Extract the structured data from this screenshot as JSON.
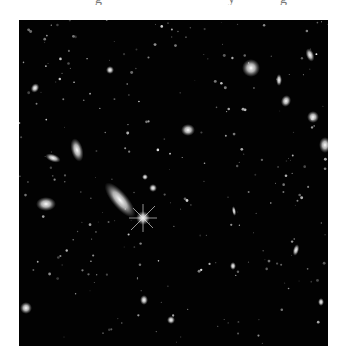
{
  "page": {
    "top_text_fragments": [
      "g",
      "y",
      "g"
    ]
  },
  "figure": {
    "background_color": "#020202",
    "frame": {
      "x": 19,
      "y": 20,
      "width": 309,
      "height": 326
    },
    "objects": [
      {
        "type": "star",
        "x": 143,
        "y": 218,
        "r": 7,
        "spikes": true
      },
      {
        "type": "galaxy",
        "x": 120,
        "y": 200,
        "rx": 22,
        "ry": 8,
        "rot": 50
      },
      {
        "type": "galaxy",
        "x": 46,
        "y": 204,
        "rx": 10,
        "ry": 7,
        "rot": 0
      },
      {
        "type": "galaxy",
        "x": 77,
        "y": 150,
        "rx": 6,
        "ry": 12,
        "rot": -15
      },
      {
        "type": "galaxy",
        "x": 53,
        "y": 158,
        "rx": 8,
        "ry": 4,
        "rot": 20
      },
      {
        "type": "galaxy",
        "x": 188,
        "y": 130,
        "rx": 7,
        "ry": 6,
        "rot": 0
      },
      {
        "type": "galaxy",
        "x": 251,
        "y": 68,
        "rx": 9,
        "ry": 9,
        "rot": 0
      },
      {
        "type": "galaxy",
        "x": 310,
        "y": 55,
        "rx": 4,
        "ry": 7,
        "rot": -20
      },
      {
        "type": "galaxy",
        "x": 279,
        "y": 80,
        "rx": 3,
        "ry": 6,
        "rot": 0
      },
      {
        "type": "galaxy",
        "x": 286,
        "y": 101,
        "rx": 5,
        "ry": 6,
        "rot": 20
      },
      {
        "type": "galaxy",
        "x": 313,
        "y": 117,
        "rx": 6,
        "ry": 6,
        "rot": 0
      },
      {
        "type": "galaxy",
        "x": 325,
        "y": 145,
        "rx": 6,
        "ry": 8,
        "rot": 0
      },
      {
        "type": "galaxy",
        "x": 110,
        "y": 70,
        "rx": 4,
        "ry": 4,
        "rot": 0
      },
      {
        "type": "galaxy",
        "x": 35,
        "y": 88,
        "rx": 4,
        "ry": 5,
        "rot": 30
      },
      {
        "type": "galaxy",
        "x": 26,
        "y": 308,
        "rx": 6,
        "ry": 6,
        "rot": 0
      },
      {
        "type": "galaxy",
        "x": 144,
        "y": 300,
        "rx": 4,
        "ry": 5,
        "rot": 0
      },
      {
        "type": "galaxy",
        "x": 171,
        "y": 320,
        "rx": 4,
        "ry": 4,
        "rot": 0
      },
      {
        "type": "galaxy",
        "x": 233,
        "y": 266,
        "rx": 3,
        "ry": 4,
        "rot": 0
      },
      {
        "type": "galaxy",
        "x": 296,
        "y": 250,
        "rx": 3,
        "ry": 6,
        "rot": 15
      },
      {
        "type": "galaxy",
        "x": 234,
        "y": 211,
        "rx": 2,
        "ry": 5,
        "rot": -10
      },
      {
        "type": "galaxy",
        "x": 153,
        "y": 188,
        "rx": 4,
        "ry": 4,
        "rot": 0
      },
      {
        "type": "galaxy",
        "x": 145,
        "y": 177,
        "rx": 3,
        "ry": 3,
        "rot": 0
      },
      {
        "type": "galaxy",
        "x": 321,
        "y": 302,
        "rx": 3,
        "ry": 4,
        "rot": 0
      }
    ]
  }
}
